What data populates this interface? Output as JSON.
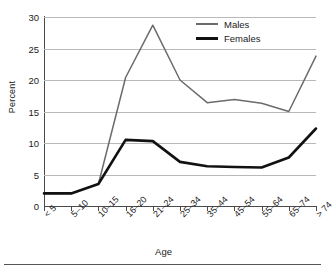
{
  "chart_data": {
    "type": "line",
    "title": "",
    "xlabel": "Age",
    "ylabel": "Percent",
    "categories": [
      "< 5",
      "5–10",
      "10–15",
      "16–20",
      "21–24",
      "25–34",
      "35–44",
      "45–54",
      "55–64",
      "65–74",
      "> 74"
    ],
    "ylim": [
      0,
      30
    ],
    "yticks": [
      0,
      5,
      10,
      15,
      20,
      25,
      30
    ],
    "ytick_labels": [
      "0",
      "5",
      "10",
      "15",
      "20",
      "25",
      "30"
    ],
    "grid": true,
    "legend_position": "top-right",
    "series": [
      {
        "name": "Males",
        "color": "#6b6b6b",
        "values": [
          2.0,
          2.0,
          3.5,
          20.4,
          28.7,
          20.0,
          16.4,
          16.9,
          16.3,
          15.0,
          23.8
        ]
      },
      {
        "name": "Females",
        "color": "#111111",
        "values": [
          2.0,
          2.0,
          3.5,
          10.5,
          10.3,
          7.0,
          6.3,
          6.2,
          6.1,
          7.7,
          12.3
        ]
      }
    ]
  },
  "legend": {
    "items": [
      {
        "label": "Males"
      },
      {
        "label": "Females"
      }
    ]
  },
  "axes": {
    "y_title": "Percent",
    "x_title": "Age"
  }
}
